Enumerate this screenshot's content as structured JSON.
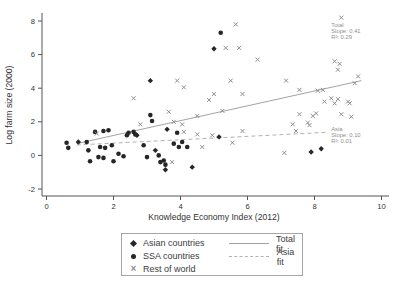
{
  "chart_data": {
    "type": "scatter",
    "title": "",
    "xlabel": "Knowledge Economy Index (2012)",
    "ylabel": "Log farm size (2000)",
    "xlim": [
      0,
      10
    ],
    "ylim": [
      -2,
      8
    ],
    "xticks": [
      0,
      2,
      4,
      6,
      8,
      10
    ],
    "yticks": [
      -2,
      0,
      2,
      4,
      6,
      8
    ],
    "grid": false,
    "legend_position": "bottom-center",
    "colors": {
      "dark_marker": "#262626",
      "x_marker": "#8f8f8f",
      "total_fit": "#a3a3a3",
      "asia_fit": "#b2b2b2",
      "annotation_text": "#8f8f8f",
      "axis": "#555555",
      "tick_label": "#333333"
    },
    "series": [
      {
        "name": "Asian countries",
        "marker": "diamond",
        "color": "#262626",
        "points": [
          [
            3.1,
            4.45
          ],
          [
            5.0,
            6.35
          ],
          [
            7.9,
            0.2
          ],
          [
            8.2,
            0.4
          ],
          [
            0.95,
            0.8
          ],
          [
            3.6,
            1.55
          ],
          [
            2.7,
            1.2
          ],
          [
            3.25,
            0.3
          ],
          [
            5.15,
            1.1
          ],
          [
            4.35,
            -0.7
          ],
          [
            3.55,
            -0.85
          ]
        ]
      },
      {
        "name": "SSA countries",
        "marker": "circle",
        "color": "#262626",
        "points": [
          [
            5.2,
            7.3
          ],
          [
            3.1,
            2.4
          ],
          [
            3.15,
            2.05
          ],
          [
            0.6,
            0.75
          ],
          [
            0.65,
            0.45
          ],
          [
            1.2,
            0.8
          ],
          [
            1.25,
            0.3
          ],
          [
            1.45,
            1.4
          ],
          [
            1.7,
            1.45
          ],
          [
            1.85,
            1.5
          ],
          [
            1.6,
            0.5
          ],
          [
            1.75,
            0.45
          ],
          [
            1.95,
            0.6
          ],
          [
            1.55,
            -0.1
          ],
          [
            1.7,
            -0.15
          ],
          [
            1.3,
            -0.35
          ],
          [
            2.0,
            -0.35
          ],
          [
            2.15,
            0.1
          ],
          [
            2.3,
            -0.05
          ],
          [
            2.4,
            1.2
          ],
          [
            2.45,
            1.35
          ],
          [
            2.6,
            1.4
          ],
          [
            2.65,
            1.25
          ],
          [
            2.9,
            0.6
          ],
          [
            3.0,
            -0.1
          ],
          [
            3.35,
            0.0
          ],
          [
            3.5,
            -0.3
          ],
          [
            3.55,
            -0.55
          ],
          [
            3.9,
            1.35
          ],
          [
            3.8,
            0.7
          ],
          [
            4.05,
            0.8
          ],
          [
            3.95,
            0.5
          ],
          [
            4.2,
            0.5
          ],
          [
            3.4,
            -0.4
          ]
        ]
      },
      {
        "name": "Rest of world",
        "marker": "x",
        "color": "#8f8f8f",
        "points": [
          [
            2.6,
            3.4
          ],
          [
            5.65,
            7.8
          ],
          [
            8.8,
            8.2
          ],
          [
            5.35,
            6.4
          ],
          [
            5.75,
            6.4
          ],
          [
            6.3,
            5.7
          ],
          [
            3.9,
            4.45
          ],
          [
            4.1,
            4.05
          ],
          [
            5.5,
            4.45
          ],
          [
            5.0,
            3.65
          ],
          [
            5.85,
            3.65
          ],
          [
            4.85,
            3.3
          ],
          [
            8.6,
            5.6
          ],
          [
            8.75,
            5.45
          ],
          [
            8.7,
            5.1
          ],
          [
            7.15,
            4.45
          ],
          [
            7.55,
            3.9
          ],
          [
            8.1,
            3.85
          ],
          [
            8.25,
            3.9
          ],
          [
            9.2,
            4.3
          ],
          [
            9.3,
            4.7
          ],
          [
            8.5,
            3.4
          ],
          [
            8.7,
            3.35
          ],
          [
            9.0,
            3.2
          ],
          [
            8.6,
            3.1
          ],
          [
            8.3,
            3.2
          ],
          [
            9.05,
            3.1
          ],
          [
            5.25,
            2.65
          ],
          [
            4.5,
            2.35
          ],
          [
            3.65,
            2.6
          ],
          [
            3.8,
            2.0
          ],
          [
            4.05,
            1.85
          ],
          [
            4.5,
            1.25
          ],
          [
            4.95,
            1.2
          ],
          [
            5.85,
            1.45
          ],
          [
            5.55,
            0.75
          ],
          [
            4.65,
            0.5
          ],
          [
            7.55,
            2.45
          ],
          [
            8.05,
            2.5
          ],
          [
            7.95,
            2.35
          ],
          [
            8.8,
            2.45
          ],
          [
            9.1,
            2.3
          ],
          [
            7.35,
            1.85
          ],
          [
            7.8,
            1.95
          ],
          [
            7.85,
            1.8
          ],
          [
            7.45,
            1.45
          ],
          [
            7.1,
            0.15
          ],
          [
            2.8,
            1.85
          ],
          [
            1.5,
            1.3
          ],
          [
            4.1,
            1.4
          ],
          [
            3.75,
            -0.4
          ]
        ]
      }
    ],
    "fits": [
      {
        "name": "Total fit",
        "style": "solid",
        "color": "#a3a3a3",
        "x1": 0.9,
        "y1": 0.7,
        "x2": 9.4,
        "y2": 4.45
      },
      {
        "name": "Asia fit",
        "style": "dashed",
        "color": "#b2b2b2",
        "x1": 0.9,
        "y1": 0.62,
        "x2": 8.35,
        "y2": 1.37
      }
    ],
    "annotations": [
      {
        "name": "total-stats",
        "x": 8.5,
        "y": 7.65,
        "lines": [
          "Total",
          "Slope: 0.41",
          "R²: 0.29"
        ]
      },
      {
        "name": "asia-stats",
        "x": 8.5,
        "y": 1.48,
        "lines": [
          "Asia",
          "Slope: 0.10",
          "R²: 0.01"
        ]
      }
    ]
  },
  "legend": {
    "items": [
      {
        "label": "Asian countries",
        "marker": "diamond"
      },
      {
        "label": "SSA countries",
        "marker": "circle"
      },
      {
        "label": "Rest of world",
        "marker": "x"
      }
    ],
    "lines": [
      {
        "label": "Total fit",
        "style": "solid"
      },
      {
        "label": "Asia fit",
        "style": "dashed"
      }
    ]
  }
}
